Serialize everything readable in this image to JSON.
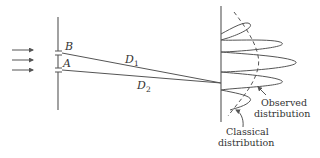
{
  "diagram": {
    "title": "",
    "colors": {
      "stroke": "#555555",
      "text": "#333333",
      "background": "#ffffff"
    },
    "incident_arrows": [
      {
        "y": 50
      },
      {
        "y": 60
      },
      {
        "y": 70
      }
    ],
    "slits": {
      "B": {
        "label": "B",
        "y": 53
      },
      "A": {
        "label": "A",
        "y": 70
      }
    },
    "paths": {
      "D1": {
        "label": "D",
        "subscript": "1"
      },
      "D2": {
        "label": "D",
        "subscript": "2"
      }
    },
    "screen_labels": {
      "observed_line1": "Observed",
      "observed_line2": "distribution",
      "classical_line1": "Classical",
      "classical_line2": "distribution"
    }
  }
}
